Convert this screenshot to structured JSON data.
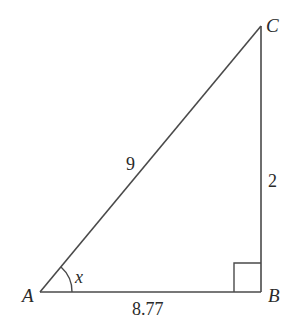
{
  "diagram": {
    "type": "right-triangle",
    "vertices": [
      {
        "name": "A",
        "x": 40,
        "y": 292
      },
      {
        "name": "B",
        "x": 261,
        "y": 292
      },
      {
        "name": "C",
        "x": 261,
        "y": 26
      }
    ],
    "sides": {
      "AC": "9",
      "BC": "2",
      "AB": "8.77"
    },
    "angle_label": "x",
    "right_angle_at": "B",
    "stroke_color": "#4a4a4a"
  }
}
